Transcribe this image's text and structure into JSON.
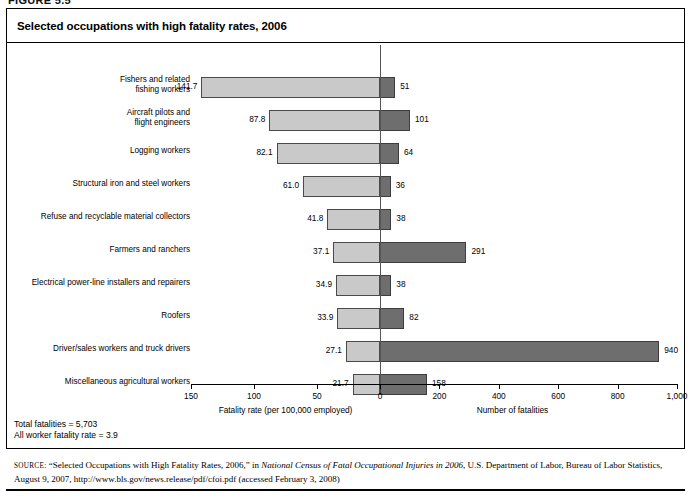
{
  "figure_tag": "FIGURE 5.5",
  "title": "Selected occupations with high fatality rates, 2006",
  "notes": {
    "total_fatalities": "Total fatalities = 5,703",
    "all_worker_rate": "All worker fatality rate = 3.9"
  },
  "source": {
    "lead": "SOURCE:",
    "part1": " “Selected Occupations with High Fatality Rates, 2006,” in ",
    "italic": "National Census of Fatal Occupational Injuries in 2006",
    "part2": ", U.S. Department of Labor, Bureau of Labor Statistics, August 9, 2007, http://www.bls.gov/news.release/pdf/cfoi.pdf (accessed February 3, 2008)"
  },
  "colors": {
    "rate_bar": "#c9c9c9",
    "count_bar": "#6e6e6e",
    "axis": "#000000",
    "zero_line": "#555555"
  },
  "chart_data": {
    "type": "bar",
    "title": "Selected occupations with high fatality rates, 2006",
    "orientation": "horizontal-bidirectional",
    "categories": [
      "Fishers and related\nfishing workers",
      "Aircraft pilots and\nflight engineers",
      "Logging workers",
      "Structural iron and steel workers",
      "Refuse and recyclable material collectors",
      "Farmers and ranchers",
      "Electrical power-line installers and repairers",
      "Roofers",
      "Driver/sales workers and truck drivers",
      "Miscellaneous agricultural workers"
    ],
    "series": [
      {
        "name": "Fatality rate (per 100,000 employed)",
        "side": "left",
        "axis_label": "Fatality rate (per 100,000 employed)",
        "ticks": [
          150,
          100,
          50,
          0
        ],
        "tick_labels": [
          "150",
          "100",
          "50",
          "0"
        ],
        "range": [
          0,
          150
        ],
        "values": [
          141.7,
          87.8,
          82.1,
          61.0,
          41.8,
          37.1,
          34.9,
          33.9,
          27.1,
          21.7
        ],
        "value_labels": [
          "141.7",
          "87.8",
          "82.1",
          "61.0",
          "41.8",
          "37.1",
          "34.9",
          "33.9",
          "27.1",
          "21.7"
        ]
      },
      {
        "name": "Number of fatalities",
        "side": "right",
        "axis_label": "Number of fatalities",
        "ticks": [
          0,
          200,
          400,
          600,
          800,
          1000
        ],
        "tick_labels": [
          "0",
          "200",
          "400",
          "600",
          "800",
          "1,000"
        ],
        "range": [
          0,
          1000
        ],
        "values": [
          51,
          101,
          64,
          36,
          38,
          291,
          38,
          82,
          940,
          158
        ],
        "value_labels": [
          "51",
          "101",
          "64",
          "36",
          "38",
          "291",
          "38",
          "82",
          "940",
          "158"
        ]
      }
    ],
    "grid": false,
    "legend": "none"
  }
}
